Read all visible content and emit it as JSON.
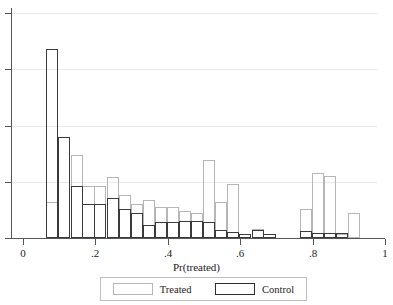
{
  "chart_data": {
    "type": "bar",
    "title": "",
    "subtitle": "",
    "xlabel": "Pr(treated)",
    "ylabel": "",
    "xlim": [
      0,
      1
    ],
    "ylim": [
      0,
      1
    ],
    "grid": true,
    "legend_position": "bottom",
    "bin_width": 0.0333,
    "x_ticks": [
      "0",
      ".2",
      ".4",
      ".6",
      ".8",
      "1"
    ],
    "x_tick_values": [
      0,
      0.2,
      0.4,
      0.6,
      0.8,
      1
    ],
    "y_ticks": [
      "",
      "",
      "",
      "",
      ""
    ],
    "y_tick_values": [
      0,
      0.25,
      0.5,
      0.75,
      1.0
    ],
    "bin_centers": [
      0.081,
      0.114,
      0.148,
      0.181,
      0.214,
      0.248,
      0.281,
      0.314,
      0.348,
      0.381,
      0.414,
      0.448,
      0.481,
      0.514,
      0.548,
      0.581,
      0.614,
      0.648,
      0.681,
      0.781,
      0.814,
      0.848,
      0.881,
      0.914
    ],
    "series": [
      {
        "name": "Treated",
        "color": "#b6b6b6",
        "values": [
          0.16,
          0.45,
          0.37,
          0.23,
          0.23,
          0.27,
          0.19,
          0.15,
          0.17,
          0.14,
          0.14,
          0.12,
          0.11,
          0.345,
          0.16,
          0.24,
          0.02,
          0.04,
          0.02,
          0.13,
          0.29,
          0.275,
          0.02,
          0.11
        ]
      },
      {
        "name": "Control",
        "color": "#3a3a3a",
        "values": [
          0.84,
          0.45,
          0.23,
          0.15,
          0.15,
          0.18,
          0.13,
          0.11,
          0.06,
          0.07,
          0.07,
          0.075,
          0.075,
          0.07,
          0.035,
          0.025,
          0.02,
          0.035,
          0.02,
          0.03,
          0.022,
          0.022,
          0.022,
          0.0
        ]
      }
    ]
  },
  "legend": {
    "entries": [
      {
        "label": "Treated",
        "swatch": "treated-swatch"
      },
      {
        "label": "Control",
        "swatch": "control-swatch"
      }
    ]
  },
  "axis": {
    "x_title": "Pr(treated)"
  }
}
